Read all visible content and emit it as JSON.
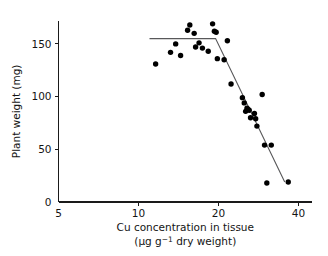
{
  "chart_data": {
    "type": "scatter",
    "title": "",
    "xlabel": "Cu concentration in tissue",
    "xlabel_line2": "(µg g⁻¹ dry weight)",
    "xlabel_units_prefix": "(µg g",
    "xlabel_units_sup": "−1",
    "xlabel_units_suffix": " dry weight)",
    "ylabel": "Plant weight (mg)",
    "xscale": "log",
    "yscale": "linear",
    "xlim": [
      5,
      45
    ],
    "ylim": [
      0,
      175
    ],
    "xticks": [
      5,
      10,
      20,
      40
    ],
    "xtick_labels": [
      "5",
      "10",
      "20",
      "40"
    ],
    "yticks": [
      0,
      50,
      100,
      150
    ],
    "ytick_labels": [
      "0",
      "50",
      "100",
      "150"
    ],
    "grid": false,
    "legend": "none",
    "series": [
      {
        "name": "Plant weight vs Cu concentration",
        "marker": "filled-circle",
        "marker_color": "#000000",
        "points": [
          [
            11.6,
            131
          ],
          [
            13.2,
            142
          ],
          [
            13.8,
            150
          ],
          [
            14.4,
            139
          ],
          [
            15.3,
            163
          ],
          [
            15.6,
            168
          ],
          [
            16.2,
            160
          ],
          [
            16.4,
            147
          ],
          [
            16.9,
            151
          ],
          [
            17.4,
            146
          ],
          [
            18.3,
            143
          ],
          [
            19.0,
            169
          ],
          [
            19.3,
            162
          ],
          [
            19.6,
            161
          ],
          [
            19.8,
            136
          ],
          [
            21.0,
            135
          ],
          [
            21.6,
            153
          ],
          [
            22.3,
            112
          ],
          [
            24.6,
            99
          ],
          [
            25.0,
            94
          ],
          [
            25.3,
            86
          ],
          [
            25.6,
            89
          ],
          [
            25.8,
            88
          ],
          [
            26.1,
            87
          ],
          [
            26.4,
            80
          ],
          [
            27.3,
            84
          ],
          [
            27.6,
            79
          ],
          [
            27.9,
            72
          ],
          [
            29.2,
            102
          ],
          [
            29.8,
            54
          ],
          [
            30.4,
            18
          ],
          [
            31.6,
            54
          ],
          [
            36.6,
            19
          ]
        ]
      }
    ],
    "fit": {
      "type": "broken-stick",
      "description": "Plateau then linear decline",
      "plateau_y": 155,
      "plateau_x_start": 11.0,
      "breakpoint_x": 19.5,
      "end_x": 35.5,
      "end_y": 19,
      "color": "#58585a"
    }
  },
  "axes": {
    "x_axis_name": "x-axis",
    "y_axis_name": "y-axis"
  }
}
